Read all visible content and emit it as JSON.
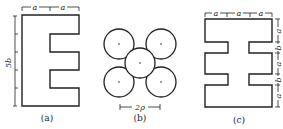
{
  "figures": [
    {
      "id": "a",
      "caption": "(a)",
      "shape": "E-shaped cross-section",
      "top_dims": [
        "a",
        "a"
      ],
      "side_dim": "5b"
    },
    {
      "id": "b",
      "caption": "(b)",
      "shape": "five circles (quincunx arrangement)",
      "circle_count": 5,
      "dim_label": "2ρ"
    },
    {
      "id": "c",
      "caption": "(c)",
      "shape": "double-notched cross-section",
      "top_dims": [
        "a",
        "a",
        "a"
      ],
      "side_dims": [
        "a",
        "b",
        "a",
        "b",
        "a"
      ]
    }
  ],
  "colors": {
    "line": "#222222",
    "background": "#ffffff"
  }
}
